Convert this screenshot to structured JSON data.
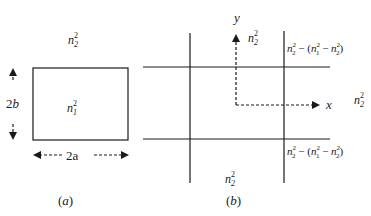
{
  "panel_a": {
    "outer_label": {
      "base": "n",
      "sup": "2",
      "sub": "2"
    },
    "inner_label": {
      "base": "n",
      "sup": "2",
      "sub": "1"
    },
    "height_label": "2b",
    "width_label": "2a",
    "caption": "(a)"
  },
  "panel_b": {
    "y_axis_label": "y",
    "x_axis_label": "x",
    "region_top_center": {
      "base": "n",
      "sup": "2",
      "sub": "2"
    },
    "region_right": {
      "base": "n",
      "sup": "2",
      "sub": "2"
    },
    "region_bottom_center": {
      "base": "n",
      "sup": "2",
      "sub": "2"
    },
    "region_top_right": "n₂² − (n₁² − n₂²)",
    "region_bottom_right": "n₂² − (n₁² − n₂²)",
    "caption": "(b)"
  },
  "colors": {
    "ink": "#1a1a1a",
    "background": "#ffffff"
  }
}
